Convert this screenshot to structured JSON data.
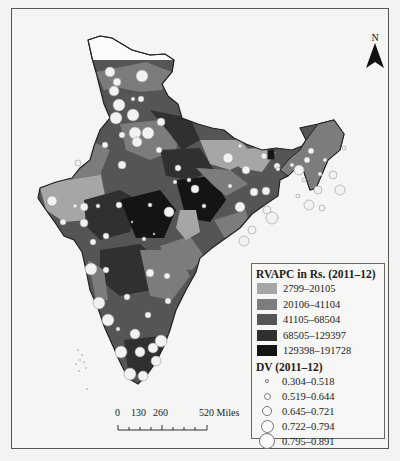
{
  "map": {
    "title": "India districts — RVAPC and DV",
    "north_label": "N",
    "legend": {
      "choropleth_title": "RVAPC in Rs. (2011–12)",
      "classes": [
        {
          "label": "2799–20105",
          "color": "#a6a6a6"
        },
        {
          "label": "20106–41104",
          "color": "#7c7c7c"
        },
        {
          "label": "41105–68504",
          "color": "#555555"
        },
        {
          "label": "68505–129397",
          "color": "#303030"
        },
        {
          "label": "129398–191728",
          "color": "#141414"
        }
      ],
      "symbol_title": "DV (2011–12)",
      "symbols": [
        {
          "label": "0.304–0.518",
          "size": 4
        },
        {
          "label": "0.519–0.644",
          "size": 7
        },
        {
          "label": "0.645–0.721",
          "size": 10
        },
        {
          "label": "0.722–0.794",
          "size": 13
        },
        {
          "label": "0.795–0.891",
          "size": 16
        }
      ]
    },
    "scale_bar": {
      "ticks": [
        "0",
        "130",
        "260",
        "520 Miles"
      ]
    }
  }
}
